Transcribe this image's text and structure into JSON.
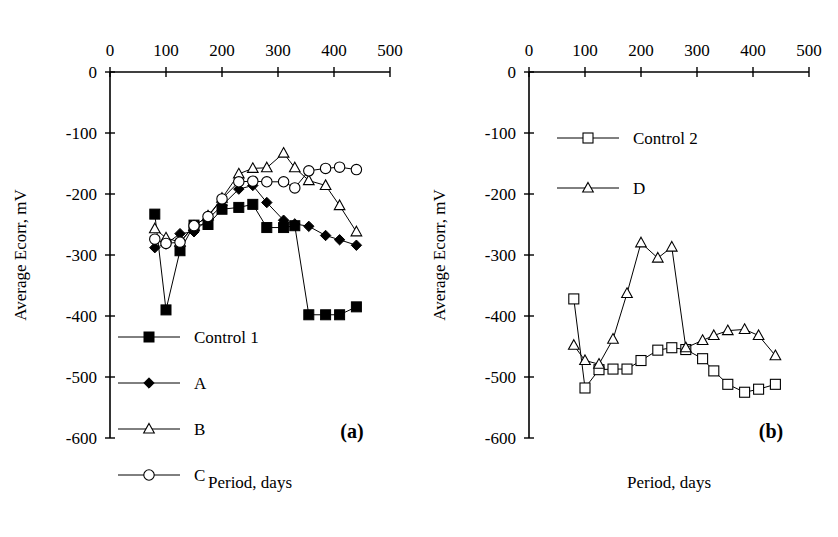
{
  "figure": {
    "panels": [
      {
        "id": "a",
        "panel_label": "(a)",
        "xlabel": "Period, days",
        "ylabel": "Average Ecorr, mV"
      },
      {
        "id": "b",
        "panel_label": "(b)",
        "xlabel": "Period, days",
        "ylabel": "Average Ecorr, mV"
      }
    ]
  },
  "axis": {
    "x_ticks": [
      "0",
      "100",
      "200",
      "300",
      "400",
      "500"
    ],
    "y_ticks": [
      "0",
      "-100",
      "-200",
      "-300",
      "-400",
      "-500",
      "-600"
    ],
    "xlim": [
      0,
      500
    ],
    "ylim": [
      -600,
      0
    ]
  },
  "colors": {
    "line": "#000000",
    "marker_fill_filled": "#000000",
    "marker_fill_open": "#ffffff",
    "background": "#ffffff"
  },
  "chart_data": [
    {
      "type": "line",
      "panel": "a",
      "title": "",
      "xlabel": "Period, days",
      "ylabel": "Average Ecorr, mV",
      "xlim": [
        0,
        500
      ],
      "ylim": [
        -600,
        0
      ],
      "grid": false,
      "legend_position": "lower-left",
      "annotation": "(a)",
      "series": [
        {
          "name": "Control 1",
          "marker": "filled-square",
          "x": [
            80,
            100,
            125,
            150,
            175,
            200,
            230,
            255,
            280,
            310,
            330,
            355,
            385,
            410,
            440
          ],
          "y": [
            -233,
            -390,
            -293,
            -251,
            -250,
            -225,
            -222,
            -217,
            -255,
            -255,
            -252,
            -398,
            -398,
            -398,
            -385
          ]
        },
        {
          "name": "A",
          "marker": "filled-diamond",
          "x": [
            80,
            100,
            125,
            150,
            175,
            200,
            230,
            255,
            280,
            310,
            330,
            355,
            385,
            410,
            440
          ],
          "y": [
            -288,
            -282,
            -265,
            -262,
            -241,
            -219,
            -192,
            -186,
            -214,
            -243,
            -249,
            -253,
            -268,
            -275,
            -284
          ]
        },
        {
          "name": "B",
          "marker": "open-triangle",
          "x": [
            80,
            100,
            125,
            150,
            175,
            200,
            230,
            255,
            280,
            310,
            330,
            355,
            385,
            410,
            440
          ],
          "y": [
            -257,
            -272,
            -279,
            -253,
            -236,
            -207,
            -167,
            -158,
            -157,
            -133,
            -157,
            -178,
            -186,
            -219,
            -262
          ]
        },
        {
          "name": "C",
          "marker": "open-circle",
          "x": [
            80,
            100,
            125,
            150,
            175,
            200,
            230,
            255,
            280,
            310,
            330,
            355,
            385,
            410,
            440
          ],
          "y": [
            -274,
            -281,
            -279,
            -252,
            -237,
            -208,
            -180,
            -179,
            -180,
            -180,
            -190,
            -162,
            -158,
            -156,
            -160
          ]
        }
      ]
    },
    {
      "type": "line",
      "panel": "b",
      "title": "",
      "xlabel": "Period, days",
      "ylabel": "Average Ecorr, mV",
      "xlim": [
        0,
        500
      ],
      "ylim": [
        -600,
        0
      ],
      "grid": false,
      "legend_position": "upper-center",
      "annotation": "(b)",
      "series": [
        {
          "name": "Control 2",
          "marker": "open-square",
          "x": [
            80,
            100,
            125,
            150,
            175,
            200,
            230,
            255,
            280,
            310,
            330,
            355,
            385,
            410,
            440
          ],
          "y": [
            -372,
            -518,
            -488,
            -487,
            -487,
            -473,
            -456,
            -452,
            -455,
            -470,
            -490,
            -512,
            -525,
            -520,
            -512
          ]
        },
        {
          "name": "D",
          "marker": "open-triangle",
          "x": [
            80,
            100,
            125,
            150,
            175,
            200,
            230,
            255,
            280,
            310,
            330,
            355,
            385,
            410,
            440
          ],
          "y": [
            -448,
            -473,
            -479,
            -438,
            -363,
            -280,
            -305,
            -287,
            -452,
            -440,
            -432,
            -424,
            -422,
            -432,
            -465
          ]
        }
      ]
    }
  ],
  "legends": {
    "panel_a": [
      {
        "label": "Control 1",
        "marker": "filled-square"
      },
      {
        "label": "A",
        "marker": "filled-diamond"
      },
      {
        "label": "B",
        "marker": "open-triangle"
      },
      {
        "label": "C",
        "marker": "open-circle"
      }
    ],
    "panel_b": [
      {
        "label": "Control 2",
        "marker": "open-square"
      },
      {
        "label": "D",
        "marker": "open-triangle"
      }
    ]
  }
}
